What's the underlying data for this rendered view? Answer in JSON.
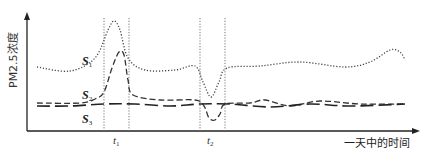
{
  "chart_data": {
    "type": "line",
    "title": "",
    "xlabel": "一天中的时间",
    "ylabel": "PM2.5浓度",
    "grid": false,
    "legend": "inline labels at left of curves",
    "x_ticks": [
      {
        "label": "t",
        "subscript": "1",
        "x": 117
      },
      {
        "label": "t",
        "subscript": "2",
        "x": 211
      }
    ],
    "reference_intervals": [
      {
        "name": "t1",
        "start": 104,
        "end": 129
      },
      {
        "name": "t2",
        "start": 200,
        "end": 225
      }
    ],
    "series": [
      {
        "name": "S1",
        "label": "S",
        "subscript": "1",
        "style": "dotted",
        "description": "High baseline; sharp peak at t1; dip at t2; rises again late in the day",
        "points": [
          [
            37,
            67
          ],
          [
            70,
            71
          ],
          [
            95,
            58
          ],
          [
            108,
            30
          ],
          [
            114,
            21
          ],
          [
            120,
            30
          ],
          [
            128,
            58
          ],
          [
            145,
            70
          ],
          [
            175,
            70
          ],
          [
            195,
            66
          ],
          [
            203,
            82
          ],
          [
            211,
            97
          ],
          [
            219,
            82
          ],
          [
            227,
            68
          ],
          [
            260,
            66
          ],
          [
            300,
            62
          ],
          [
            345,
            67
          ],
          [
            370,
            62
          ],
          [
            390,
            50
          ],
          [
            400,
            52
          ],
          [
            405,
            60
          ]
        ]
      },
      {
        "name": "S2",
        "label": "S",
        "subscript": "2",
        "style": "short-dashed",
        "description": "Low baseline; peak at t1; dip at t2; otherwise near S3",
        "points": [
          [
            37,
            103
          ],
          [
            80,
            103
          ],
          [
            95,
            99
          ],
          [
            104,
            92
          ],
          [
            112,
            68
          ],
          [
            119,
            52
          ],
          [
            124,
            55
          ],
          [
            128,
            80
          ],
          [
            133,
            95
          ],
          [
            160,
            100
          ],
          [
            195,
            100
          ],
          [
            204,
            106
          ],
          [
            209,
            118
          ],
          [
            215,
            120
          ],
          [
            220,
            114
          ],
          [
            225,
            104
          ],
          [
            250,
            103
          ],
          [
            265,
            100
          ],
          [
            290,
            106
          ],
          [
            320,
            101
          ],
          [
            360,
            104
          ],
          [
            405,
            104
          ]
        ]
      },
      {
        "name": "S3",
        "label": "S",
        "subscript": "3",
        "style": "long-dashed",
        "description": "Nearly flat low concentration throughout the day",
        "points": [
          [
            37,
            106
          ],
          [
            70,
            106
          ],
          [
            104,
            104
          ],
          [
            135,
            104
          ],
          [
            170,
            106
          ],
          [
            200,
            104
          ],
          [
            230,
            104
          ],
          [
            270,
            107
          ],
          [
            310,
            104
          ],
          [
            350,
            106
          ],
          [
            405,
            104
          ]
        ]
      }
    ],
    "axes": {
      "origin": [
        27,
        131
      ],
      "y_top": 13,
      "x_right": 420
    }
  }
}
